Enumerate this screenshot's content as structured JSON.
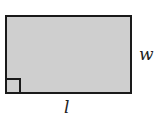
{
  "diagram": {
    "shape": "rectangle",
    "fill_color": "#cfcfcf",
    "stroke_color": "#1a1a1a",
    "labels": {
      "width": "w",
      "length": "l"
    },
    "right_angle_marker": "bottom-left"
  }
}
